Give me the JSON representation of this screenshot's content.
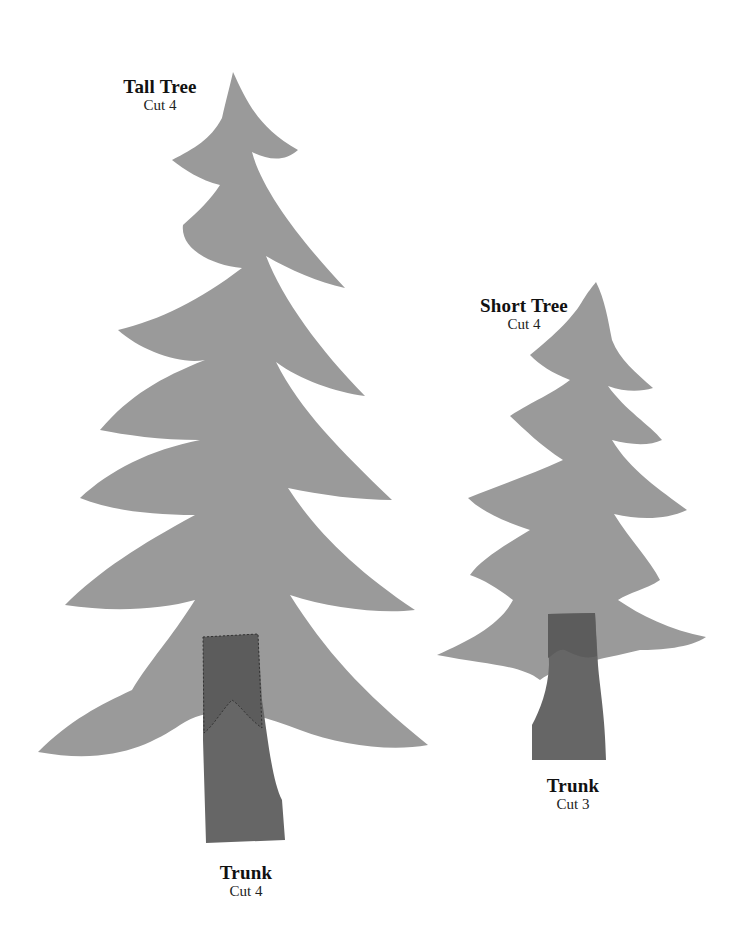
{
  "pieces": {
    "tall_tree": {
      "title": "Tall Tree",
      "instruction": "Cut 4"
    },
    "short_tree": {
      "title": "Short Tree",
      "instruction": "Cut 4"
    },
    "tall_trunk": {
      "title": "Trunk",
      "instruction": "Cut 4"
    },
    "short_trunk": {
      "title": "Trunk",
      "instruction": "Cut 3"
    }
  },
  "colors": {
    "background": "#ffffff",
    "tree_fill": "#9a9a9a",
    "trunk_fill": "#666666",
    "trunk_overlap_fill": "#5c5c5c",
    "label_text": "#111111"
  }
}
